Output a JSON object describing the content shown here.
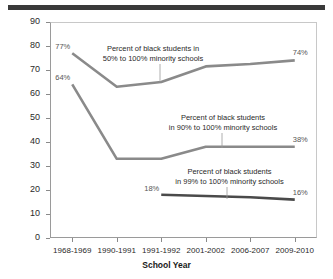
{
  "figure": {
    "top_rule_color": "#3a3a3a",
    "background": "#ffffff"
  },
  "chart_data": {
    "type": "line",
    "title": "",
    "subtitle": "",
    "xlabel": "School Year",
    "ylabel": "Percent of Black Students",
    "categories": [
      "1968-1969",
      "1990-1991",
      "1991-1992",
      "2001-2002",
      "2006-2007",
      "2009-2010"
    ],
    "ylim": [
      0,
      90
    ],
    "ytick_labels": [
      "0",
      "10",
      "20",
      "30",
      "40",
      "50",
      "60",
      "70",
      "80",
      "90"
    ],
    "ytick_values": [
      0,
      10,
      20,
      30,
      40,
      50,
      60,
      70,
      80,
      90
    ],
    "grid": false,
    "legend_position": "inline-annotations",
    "series": [
      {
        "name": "Percent of black students in 50% to 100% minority schools",
        "color": "#8a8a8a",
        "values": [
          77,
          63,
          65,
          71.5,
          72.5,
          74
        ],
        "point_labels": [
          {
            "category": "1968-1969",
            "value": 77,
            "text": "77%"
          },
          {
            "category": "2009-2010",
            "value": 74,
            "text": "74%"
          }
        ]
      },
      {
        "name": "Percent of black students in 90% to 100% minority schools",
        "color": "#8a8a8a",
        "values": [
          64,
          33,
          33,
          38,
          38,
          38
        ],
        "point_labels": [
          {
            "category": "1968-1969",
            "value": 64,
            "text": "64%"
          },
          {
            "category": "2009-2010",
            "value": 38,
            "text": "38%"
          }
        ]
      },
      {
        "name": "Percent of black students in 99% to 100% minority schools",
        "color": "#4a4a4a",
        "values": [
          null,
          null,
          18,
          17.5,
          17,
          16
        ],
        "point_labels": [
          {
            "category": "1991-1992",
            "value": 18,
            "text": "18%"
          },
          {
            "category": "2009-2010",
            "value": 16,
            "text": "16%"
          }
        ]
      }
    ],
    "annotations": [
      {
        "id": "annotation-50-100",
        "text": "Percent of black students in\n50% to 100% minority schools"
      },
      {
        "id": "annotation-90-100",
        "text": "Percent of black students\nin 90% to 100% minority schools"
      },
      {
        "id": "annotation-99-100",
        "text": "Percent of black students\nin 99% to 100% minority schools"
      }
    ]
  }
}
